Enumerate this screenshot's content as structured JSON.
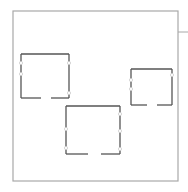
{
  "diagram": {
    "type": "floor-plan",
    "colors": {
      "background": "#ffffff",
      "outer_wall": "#a8a8a8",
      "room_wall": "#555555",
      "window_marker": "#cccccc"
    },
    "outer": {
      "x": 13,
      "y": 11,
      "w": 165,
      "h": 170
    },
    "outer_tick": {
      "x1": 178,
      "y1": 32,
      "x2": 188,
      "y2": 32
    },
    "rooms": [
      {
        "id": "room-1",
        "x": 21,
        "y": 54,
        "w": 48,
        "h": 44,
        "door": {
          "side": "bottom",
          "from": 20,
          "to": 30
        },
        "markers": [
          {
            "side": "left",
            "pos": 9
          },
          {
            "side": "left",
            "pos": 20
          },
          {
            "side": "right",
            "pos": 9
          },
          {
            "side": "right",
            "pos": 39
          }
        ]
      },
      {
        "id": "room-2",
        "x": 66,
        "y": 106,
        "w": 54,
        "h": 48,
        "door": {
          "side": "bottom",
          "from": 22,
          "to": 35
        },
        "markers": [
          {
            "side": "left",
            "pos": 23
          },
          {
            "side": "left",
            "pos": 42
          },
          {
            "side": "right",
            "pos": 8
          },
          {
            "side": "right",
            "pos": 25
          },
          {
            "side": "right",
            "pos": 43
          }
        ]
      },
      {
        "id": "room-3",
        "x": 131,
        "y": 69,
        "w": 41,
        "h": 36,
        "door": {
          "side": "bottom",
          "from": 16,
          "to": 26
        },
        "markers": [
          {
            "side": "left",
            "pos": 11
          },
          {
            "side": "left",
            "pos": 20
          },
          {
            "side": "right",
            "pos": 6
          }
        ]
      }
    ]
  }
}
